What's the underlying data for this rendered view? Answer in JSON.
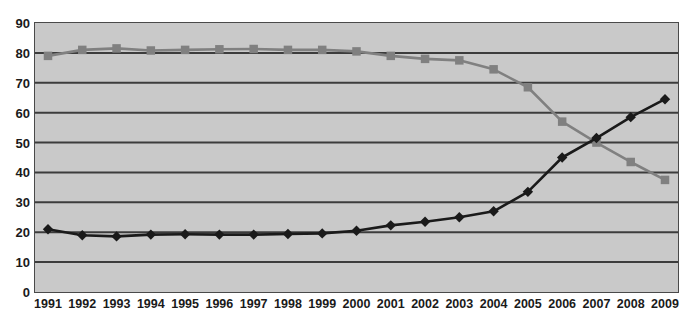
{
  "chart_data": {
    "type": "line",
    "title": "",
    "subtitle": "",
    "xlabel": "",
    "ylabel": "",
    "x": [
      1991,
      1992,
      1993,
      1994,
      1995,
      1996,
      1997,
      1998,
      1999,
      2000,
      2001,
      2002,
      2003,
      2004,
      2005,
      2006,
      2007,
      2008,
      2009
    ],
    "categories": [
      "1991",
      "1992",
      "1993",
      "1994",
      "1995",
      "1996",
      "1997",
      "1998",
      "1999",
      "2000",
      "2001",
      "2002",
      "2003",
      "2004",
      "2005",
      "2006",
      "2007",
      "2008",
      "2009"
    ],
    "series": [
      {
        "name": "series-squares",
        "marker": "square",
        "color": "#808080",
        "values": [
          79,
          81,
          81.5,
          80.8,
          81,
          81.2,
          81.3,
          81,
          81,
          80.5,
          79,
          78,
          77.5,
          74.5,
          68.5,
          57,
          50,
          43.5,
          37.5
        ]
      },
      {
        "name": "series-diamonds",
        "marker": "diamond",
        "color": "#1a1a1a",
        "values": [
          21,
          19,
          18.6,
          19.2,
          19.3,
          19.2,
          19.2,
          19.4,
          19.6,
          20.5,
          22.3,
          23.5,
          25,
          27,
          33.5,
          45,
          51.5,
          58.5,
          64.5
        ]
      }
    ],
    "ylim": [
      0,
      90
    ],
    "yticks": [
      0,
      10,
      20,
      30,
      40,
      50,
      60,
      70,
      80,
      90
    ],
    "ytick_labels": [
      "0",
      "10",
      "20",
      "30",
      "40",
      "50",
      "60",
      "70",
      "80",
      "90"
    ],
    "grid": true,
    "grid_axis": "y",
    "legend": "none",
    "plot_background": "#c9c9c9",
    "grid_color": "#3c3c3c",
    "border_color": "#4a4a4a"
  }
}
